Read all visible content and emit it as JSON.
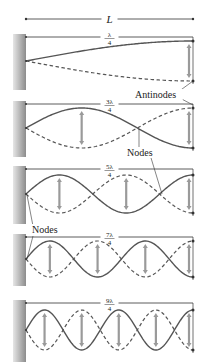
{
  "length_label": "L",
  "colors": {
    "wave": "#555555",
    "line": "#333333",
    "arrow": "#9a9a9a",
    "wall_dark": "#8c8c8c",
    "wall_light": "#e6e6e6"
  },
  "geometry": {
    "x_start": 26,
    "x_end": 193,
    "length_arrow_y": 19
  },
  "panels": [
    {
      "id": "n1",
      "fraction_num": "λ",
      "fraction_den": "4",
      "quarter_waves": 1,
      "top": 37,
      "center": 61,
      "amplitude": 20
    },
    {
      "id": "n3",
      "fraction_num": "3λ",
      "fraction_den": "4",
      "quarter_waves": 3,
      "top": 104,
      "center": 128,
      "amplitude": 20
    },
    {
      "id": "n5",
      "fraction_num": "5λ",
      "fraction_den": "4",
      "quarter_waves": 5,
      "top": 169,
      "center": 194,
      "amplitude": 19
    },
    {
      "id": "n7",
      "fraction_num": "7λ",
      "fraction_den": "4",
      "quarter_waves": 7,
      "top": 237,
      "center": 259,
      "amplitude": 18
    },
    {
      "id": "n9",
      "fraction_num": "9λ",
      "fraction_den": "4",
      "quarter_waves": 9,
      "top": 303,
      "center": 330,
      "amplitude": 20
    }
  ],
  "annotations": [
    {
      "id": "antinodes",
      "text": "Antinodes",
      "x": 135,
      "y": 98,
      "leaders": [
        [
          178,
          92,
          193,
          81
        ],
        [
          176,
          96,
          193,
          105
        ]
      ]
    },
    {
      "id": "nodes-upper",
      "text": "Nodes",
      "x": 127,
      "y": 156,
      "leaders": [
        [
          139,
          147,
          139,
          129
        ],
        [
          148,
          148,
          162,
          194
        ]
      ]
    },
    {
      "id": "nodes-lower",
      "text": "Nodes",
      "x": 32,
      "y": 233,
      "leaders": [
        [
          33,
          226,
          27,
          195
        ],
        [
          33,
          236,
          27,
          259
        ]
      ]
    }
  ]
}
